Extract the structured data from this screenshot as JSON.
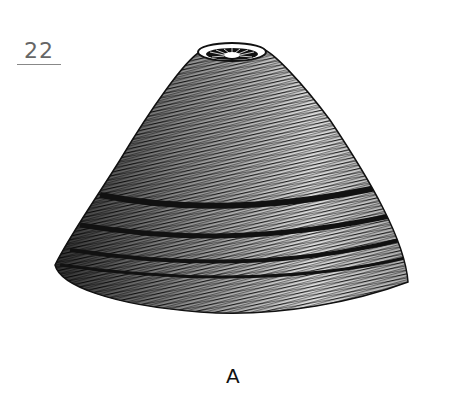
{
  "figure": {
    "number": "22",
    "panel_label": "A",
    "colors": {
      "ink": "#111111",
      "paper": "#ffffff",
      "number": "#666666"
    }
  }
}
